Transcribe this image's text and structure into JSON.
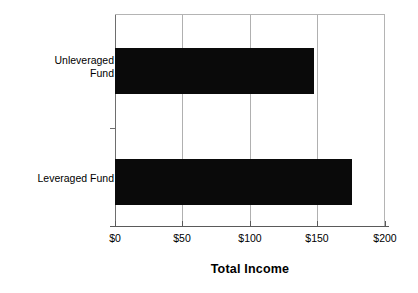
{
  "chart_data": {
    "type": "bar",
    "orientation": "horizontal",
    "title": "",
    "subtitle": "",
    "xlabel": "Total Income",
    "ylabel": "",
    "categories": [
      "Unleveraged Fund",
      "Leveraged Fund"
    ],
    "values": [
      148,
      176
    ],
    "xlim": [
      0,
      200
    ],
    "xticks": [
      0,
      50,
      100,
      150,
      200
    ],
    "xtick_labels": [
      "$0",
      "$50",
      "$100",
      "$150",
      "$200"
    ],
    "grid": true,
    "grid_axis": "x",
    "legend": false,
    "legend_position": "none",
    "bar_color": "#0a0a0a",
    "gridline_color": "#b0b0b0",
    "axis_color": "#5a5a5a",
    "background_color": "#ffffff",
    "series": [
      {
        "name": "Total Income",
        "values": [
          148,
          176
        ]
      }
    ],
    "annotations": []
  },
  "axis": {
    "x_title": "Total Income",
    "tick_labels": [
      "$0",
      "$50",
      "$100",
      "$150",
      "$200"
    ]
  },
  "categories": [
    {
      "label": "Unleveraged Fund",
      "label_lines": "Unleveraged\nFund",
      "value": 148
    },
    {
      "label": "Leveraged Fund",
      "label_lines": "Leveraged Fund",
      "value": 176
    }
  ]
}
